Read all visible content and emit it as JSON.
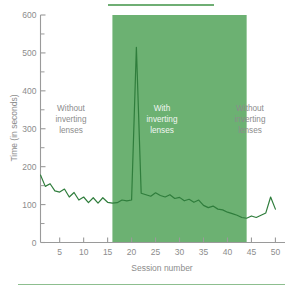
{
  "chart_data": {
    "type": "line",
    "title": "",
    "subtitle": "",
    "xlabel": "Session number",
    "ylabel": "Time (in seconds)",
    "xlim": [
      1,
      52
    ],
    "ylim": [
      0,
      600
    ],
    "grid": false,
    "legend_position": "none",
    "x_ticks": [
      5,
      10,
      15,
      20,
      25,
      30,
      35,
      40,
      45,
      50
    ],
    "x_tick_labels": [
      "5",
      "10",
      "15",
      "20",
      "25",
      "30",
      "35",
      "40",
      "45",
      "50"
    ],
    "x_minor_tick_interval": 5,
    "y_ticks": [
      0,
      100,
      200,
      300,
      400,
      500,
      600
    ],
    "y_tick_labels": [
      "0",
      "100",
      "200",
      "300",
      "400",
      "500",
      "600"
    ],
    "y_minor_ticks": [
      50,
      150,
      250,
      350,
      450,
      550
    ],
    "series": [
      {
        "name": "Time per session",
        "color": "#2f7d3c",
        "x": [
          1,
          2,
          3,
          4,
          5,
          6,
          7,
          8,
          9,
          10,
          11,
          12,
          13,
          14,
          15,
          16,
          17,
          18,
          19,
          20,
          21,
          22,
          23,
          24,
          25,
          26,
          27,
          28,
          29,
          30,
          31,
          32,
          33,
          34,
          35,
          36,
          37,
          38,
          39,
          40,
          41,
          42,
          43,
          44,
          45,
          46,
          47,
          48,
          49,
          50
        ],
        "values": [
          178,
          148,
          155,
          136,
          133,
          141,
          120,
          132,
          112,
          120,
          105,
          118,
          104,
          118,
          106,
          104,
          105,
          112,
          110,
          112,
          515,
          130,
          126,
          122,
          131,
          124,
          120,
          126,
          116,
          119,
          110,
          114,
          106,
          112,
          98,
          92,
          96,
          88,
          86,
          80,
          76,
          72,
          66,
          64,
          70,
          66,
          72,
          78,
          120,
          88
        ]
      }
    ],
    "shaded_regions": [
      {
        "name": "with-inverting-lenses-band",
        "x_start": 16,
        "x_end": 44,
        "y_start": 0,
        "y_end": 600,
        "color": "#6cb172"
      }
    ],
    "annotations": [
      {
        "name": "phase-1-label",
        "text": "Without\ninverting\nlenses",
        "lines": [
          "Without",
          "inverting",
          "lenses"
        ],
        "x": 8,
        "y": 330,
        "color": "#8c8c8c"
      },
      {
        "name": "phase-2-label",
        "text": "With\ninverting\nlenses",
        "lines": [
          "With",
          "inverting",
          "lenses"
        ],
        "x": 30,
        "y": 330,
        "color": "#f2f6f2"
      },
      {
        "name": "phase-3-label",
        "text": "Without\ninverting\nlenses",
        "lines": [
          "Without",
          "inverting",
          "lenses"
        ],
        "x": 48,
        "y": 330,
        "color": "#8c8c8c"
      }
    ]
  },
  "chart": {
    "ylabel": "Time (in seconds)",
    "xlabel": "Session number",
    "y_tick_labels": [
      "600",
      "500",
      "400",
      "300",
      "200",
      "100",
      "0"
    ],
    "x_tick_labels": [
      "5",
      "10",
      "15",
      "20",
      "25",
      "30",
      "35",
      "40",
      "45",
      "50"
    ],
    "annotation_1": {
      "line1": "Without",
      "line2": "inverting",
      "line3": "lenses"
    },
    "annotation_2": {
      "line1": "With",
      "line2": "inverting",
      "line3": "lenses"
    },
    "annotation_3": {
      "line1": "Without",
      "line2": "inverting",
      "line3": "lenses"
    }
  }
}
